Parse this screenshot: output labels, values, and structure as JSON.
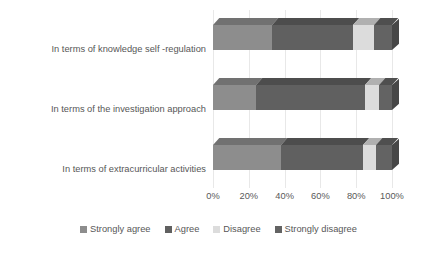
{
  "chart_data": {
    "type": "bar",
    "orientation": "horizontal",
    "stacked": true,
    "stack_mode": "percent",
    "title": "",
    "xlabel": "",
    "ylabel": "",
    "xlim": [
      0,
      100
    ],
    "grid": true,
    "legend_position": "bottom",
    "xtick_labels": [
      "0%",
      "20%",
      "40%",
      "60%",
      "80%",
      "100%"
    ],
    "xtick_values": [
      0,
      20,
      40,
      60,
      80,
      100
    ],
    "categories": [
      "In terms of knowledge self -regulation",
      "In terms of the investigation approach",
      "In terms of extracurricular activities"
    ],
    "series": [
      {
        "name": "Strongly agree",
        "color": "#8d8d8d",
        "values": [
          33,
          24,
          38
        ]
      },
      {
        "name": "Agree",
        "color": "#606060",
        "values": [
          45,
          61,
          46
        ]
      },
      {
        "name": "Disagree",
        "color": "#dcdcdc",
        "values": [
          12,
          8,
          7
        ]
      },
      {
        "name": "Strongly disagree",
        "color": "#636363",
        "values": [
          10,
          7,
          9
        ]
      }
    ]
  },
  "legend": {
    "items": [
      {
        "label": "Strongly agree"
      },
      {
        "label": "Agree"
      },
      {
        "label": "Disagree"
      },
      {
        "label": "Strongly disagree"
      }
    ]
  },
  "colors": {
    "strongly_agree": "#8d8d8d",
    "agree": "#606060",
    "disagree": "#dcdcdc",
    "strongly_disagree": "#636363",
    "gridline": "#e8e8e8",
    "text": "#575757",
    "background": "#ffffff"
  }
}
